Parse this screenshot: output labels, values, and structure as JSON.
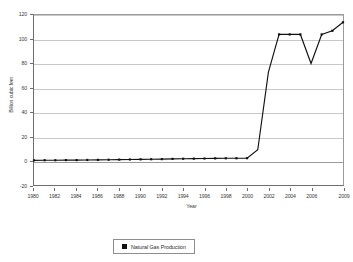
{
  "chart_data": {
    "type": "line",
    "title": "",
    "xlabel": "Year",
    "ylabel": "Billion cubic feet",
    "xlim": [
      1980,
      2009
    ],
    "ylim": [
      -20,
      120
    ],
    "yticks": [
      120,
      100,
      80,
      60,
      40,
      20,
      0,
      -20
    ],
    "ytick_labels": [
      "120",
      "100",
      "80",
      "60",
      "40",
      "20",
      "0",
      "-20"
    ],
    "xticks": [
      1980,
      1982,
      1984,
      1986,
      1988,
      1990,
      1992,
      1994,
      1996,
      1998,
      2000,
      2002,
      2004,
      2006,
      2009
    ],
    "xtick_labels": [
      "1980",
      "1982",
      "1984",
      "1986",
      "1988",
      "1990",
      "1992",
      "1994",
      "1996",
      "1998",
      "2000",
      "2002",
      "2004",
      "2006",
      "2009"
    ],
    "grid": true,
    "legend_position": "below",
    "series": [
      {
        "name": "Natural Gas Production",
        "color": "#111111",
        "marker": "square",
        "x": [
          1980,
          1981,
          1982,
          1983,
          1984,
          1985,
          1986,
          1987,
          1988,
          1989,
          1990,
          1991,
          1992,
          1993,
          1994,
          1995,
          1996,
          1997,
          1998,
          1999,
          2000,
          2001,
          2002,
          2003,
          2004,
          2005,
          2006,
          2007,
          2008,
          2009
        ],
        "values": [
          0.3,
          0.4,
          0.4,
          0.5,
          0.5,
          0.6,
          0.7,
          0.8,
          0.9,
          1.0,
          1.1,
          1.2,
          1.3,
          1.5,
          1.6,
          1.7,
          1.8,
          1.9,
          2.0,
          2.0,
          2.1,
          9.0,
          73.0,
          104.0,
          104.0,
          104.0,
          80.0,
          104.0,
          107.0,
          114.0
        ]
      }
    ]
  },
  "legend": {
    "label": "Natural Gas Production"
  }
}
